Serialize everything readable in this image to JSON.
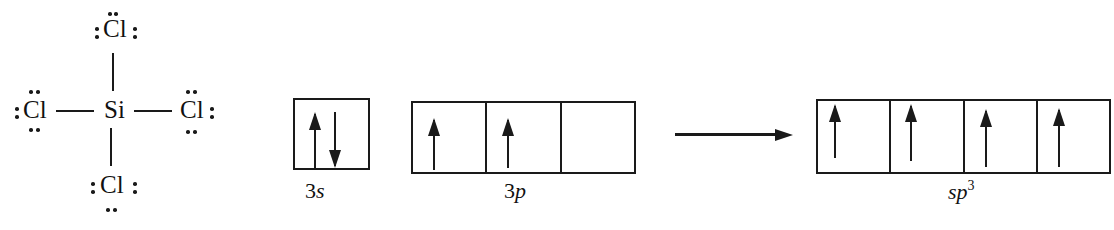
{
  "lewis_structure": {
    "central_atom": "Si",
    "top_atom": "Cl",
    "left_atom": "Cl",
    "right_atom": "Cl",
    "bottom_atom": "Cl"
  },
  "ground_state": {
    "s_label_num": "3",
    "s_label_orb": "s",
    "s_orbitals": [
      [
        "up",
        "down"
      ]
    ],
    "p_label_num": "3",
    "p_label_orb": "p",
    "p_orbitals": [
      [
        "up"
      ],
      [
        "up"
      ],
      []
    ]
  },
  "hybridized": {
    "label_orb": "sp",
    "label_sup": "3",
    "orbitals": [
      [
        "up"
      ],
      [
        "up"
      ],
      [
        "up"
      ],
      [
        "up"
      ]
    ]
  },
  "colors": {
    "ink": "#1a1a1a",
    "background": "#ffffff"
  }
}
